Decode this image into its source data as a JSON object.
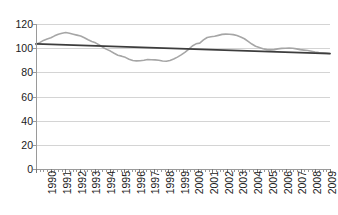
{
  "chart_data": {
    "type": "line",
    "title": "",
    "subtitle": "",
    "xlabel": "",
    "ylabel": "",
    "ylim": [
      0,
      120
    ],
    "yticks": [
      0,
      20,
      40,
      60,
      80,
      100,
      120
    ],
    "ytick_labels": [
      "0",
      "20",
      "40",
      "60",
      "80",
      "100",
      "120"
    ],
    "grid": true,
    "legend": "none",
    "categories": [
      "1990",
      "1991",
      "1992",
      "1993",
      "1994",
      "1995",
      "1996",
      "1997",
      "1998",
      "1999",
      "2000",
      "2001",
      "2002",
      "2003",
      "2004",
      "2005",
      "2006",
      "2007",
      "2008",
      "2009"
    ],
    "xtick_labels": [
      "1990",
      "1991",
      "1992",
      "1993",
      "1994",
      "1995",
      "1996",
      "1997",
      "1998",
      "1999",
      "2000",
      "2001",
      "2002",
      "2003",
      "2004",
      "2005",
      "2006",
      "2007",
      "2008",
      "2009"
    ],
    "xtick_rotation": -90,
    "minor_ticks_per_category": 4,
    "series": [
      {
        "name": "index",
        "color": "#a6a6a6",
        "style": "solid",
        "values": [
          103.5,
          108.5,
          112.8,
          110.5,
          104.5,
          98.0,
          93.0,
          89.6,
          90.3,
          90.0,
          92.5,
          101.5,
          110.5,
          111.5,
          106.5,
          100.5,
          98.5,
          99.8,
          98.0,
          95.8
        ],
        "quarterly_values": [
          103.2,
          104.6,
          106.4,
          107.6,
          108.6,
          110.2,
          111.6,
          112.4,
          112.9,
          112.4,
          111.6,
          110.8,
          110.0,
          108.6,
          107.0,
          105.6,
          104.4,
          102.6,
          100.6,
          99.0,
          97.6,
          95.8,
          94.2,
          93.4,
          92.4,
          90.8,
          89.8,
          89.5,
          89.6,
          90.0,
          90.6,
          90.4,
          90.3,
          90.0,
          89.4,
          89.2,
          89.8,
          91.0,
          92.6,
          94.4,
          96.5,
          99.0,
          101.8,
          103.6,
          104.2,
          106.8,
          108.8,
          109.4,
          109.8,
          110.6,
          111.4,
          111.6,
          111.5,
          111.2,
          110.4,
          109.2,
          107.8,
          105.6,
          103.4,
          101.6,
          100.6,
          99.6,
          98.8,
          98.6,
          98.8,
          99.4,
          99.8,
          99.9,
          100.0,
          99.9,
          99.4,
          98.8,
          98.4,
          98.0,
          97.4,
          96.8,
          96.4,
          96.2,
          95.9,
          95.6
        ]
      },
      {
        "name": "trendline",
        "color": "#3d3d3d",
        "style": "solid",
        "is_trendline": true,
        "endpoints": [
          103.6,
          95.4
        ]
      }
    ]
  },
  "axes": {
    "y_axis_name": "value-axis",
    "x_axis_name": "year-axis"
  }
}
